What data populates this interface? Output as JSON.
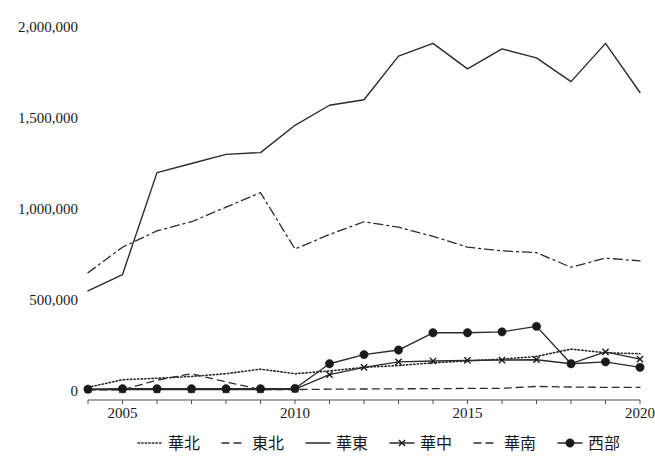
{
  "chart_data": {
    "type": "line",
    "title": "",
    "subtitle": "",
    "xlabel": "",
    "ylabel": "",
    "xlim": [
      2004,
      2020
    ],
    "ylim": [
      0,
      2000000
    ],
    "grid": false,
    "legend_position": "bottom",
    "x": [
      2004,
      2005,
      2006,
      2007,
      2008,
      2009,
      2010,
      2011,
      2012,
      2013,
      2014,
      2015,
      2016,
      2017,
      2018,
      2019,
      2020
    ],
    "xtick_labels": [
      "2005",
      "2010",
      "2015",
      "2020"
    ],
    "xtick_values": [
      2005,
      2010,
      2015,
      2020
    ],
    "ytick_labels": [
      "0",
      "500,000",
      "1,000,000",
      "1,500,000",
      "2,000,000"
    ],
    "ytick_values": [
      0,
      500000,
      1000000,
      1500000,
      2000000
    ],
    "series": [
      {
        "name": "華北",
        "style": "dotted",
        "marker": "none",
        "values": [
          20000,
          62000,
          70000,
          80000,
          95000,
          120000,
          95000,
          110000,
          130000,
          140000,
          155000,
          165000,
          175000,
          190000,
          230000,
          210000,
          205000
        ]
      },
      {
        "name": "東北",
        "style": "dashdot",
        "marker": "none",
        "values": [
          650000,
          790000,
          880000,
          930000,
          1010000,
          1090000,
          780000,
          860000,
          930000,
          900000,
          850000,
          790000,
          770000,
          760000,
          680000,
          730000,
          715000
        ]
      },
      {
        "name": "華東",
        "style": "solid",
        "marker": "none",
        "values": [
          550000,
          640000,
          1200000,
          1250000,
          1300000,
          1310000,
          1460000,
          1570000,
          1600000,
          1840000,
          1910000,
          1770000,
          1880000,
          1830000,
          1700000,
          1910000,
          1640000
        ]
      },
      {
        "name": "華中",
        "style": "solid",
        "marker": "x",
        "values": [
          8000,
          8000,
          8000,
          8000,
          8000,
          8000,
          10000,
          90000,
          130000,
          160000,
          165000,
          168000,
          170000,
          172000,
          150000,
          215000,
          175000
        ]
      },
      {
        "name": "華南",
        "style": "dashed",
        "marker": "none",
        "values": [
          6000,
          6000,
          60000,
          95000,
          50000,
          8000,
          8000,
          10000,
          11000,
          12000,
          13000,
          14000,
          15000,
          25000,
          22000,
          20000,
          20000
        ]
      },
      {
        "name": "西部",
        "style": "solid",
        "marker": "circle",
        "values": [
          10000,
          12000,
          12000,
          12000,
          12000,
          12000,
          14000,
          150000,
          200000,
          225000,
          320000,
          320000,
          325000,
          355000,
          150000,
          160000,
          130000
        ]
      }
    ]
  },
  "legend": {
    "items": [
      {
        "label": "華北",
        "style": "dotted",
        "marker": "none"
      },
      {
        "label": "東北",
        "style": "dashed",
        "marker": "none"
      },
      {
        "label": "華東",
        "style": "solid",
        "marker": "none"
      },
      {
        "label": "華中",
        "style": "solid",
        "marker": "x"
      },
      {
        "label": "華南",
        "style": "dashed",
        "marker": "none"
      },
      {
        "label": "西部",
        "style": "solid",
        "marker": "circle"
      }
    ]
  },
  "colors": {
    "line": "#2b2b2b",
    "axis": "#4d4d4d",
    "text": "#1a1a1a",
    "background": "#ffffff"
  }
}
